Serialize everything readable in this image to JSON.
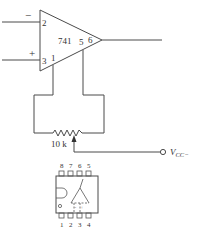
{
  "diagram": {
    "opamp": {
      "part_label": "741",
      "inverting_symbol": "−",
      "noninverting_symbol": "+",
      "pins": {
        "inverting": "2",
        "noninverting": "3",
        "offset_null_1": "1",
        "offset_null_2": "5",
        "output": "6"
      }
    },
    "potentiometer": {
      "value_label": "10 k"
    },
    "supply": {
      "label_main": "V",
      "label_sub": "CC−"
    },
    "package": {
      "top_pins": [
        "8",
        "7",
        "6",
        "5"
      ],
      "bottom_pins": [
        "1",
        "2",
        "3",
        "4"
      ]
    }
  }
}
